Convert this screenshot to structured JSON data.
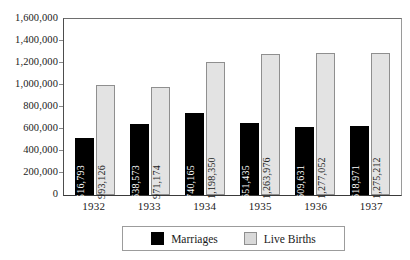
{
  "chart_data": {
    "type": "bar",
    "title": "",
    "subtitle": "",
    "xlabel": "",
    "ylabel": "",
    "categories": [
      "1932",
      "1933",
      "1934",
      "1935",
      "1936",
      "1937"
    ],
    "series": [
      {
        "name": "Marriages",
        "color": "#000000",
        "values": [
          516793,
          638573,
          740165,
          651435,
          609631,
          618971
        ],
        "labels": [
          "516,793",
          "638,573",
          "740,165",
          "651,435",
          "609,631",
          "618,971"
        ]
      },
      {
        "name": "Live Births",
        "color": "#e3e3e3",
        "values": [
          993126,
          971174,
          1198350,
          1263976,
          1277052,
          1275212
        ],
        "labels": [
          "993,126",
          "971,174",
          "1,198,350",
          "1,263,976",
          "1,277,052",
          "1,275,212"
        ]
      }
    ],
    "ylim": [
      0,
      1600000
    ],
    "ytick_values": [
      1600000,
      1400000,
      1200000,
      1000000,
      800000,
      600000,
      400000,
      200000,
      0
    ],
    "ytick_labels": [
      "1,600,000",
      "1,400,000",
      "1,200,000",
      "1,000,000",
      "800,000",
      "600,000",
      "400,000",
      "200,000",
      "0"
    ],
    "grid": false,
    "legend_position": "bottom"
  },
  "legend": {
    "entries": [
      {
        "label": "Marriages",
        "swatch": "marriages"
      },
      {
        "label": "Live Births",
        "swatch": "births"
      }
    ]
  }
}
